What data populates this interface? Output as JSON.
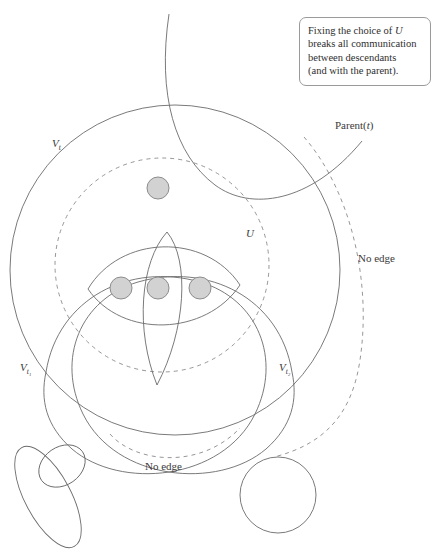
{
  "figure": {
    "title": "Fixing the choice of U breaks all communication between descendants",
    "background_color": "#ffffff",
    "stroke_color": "#6b6b6b",
    "dashed_color": "#8a8a8a",
    "node_fill_color": "#d2d2d2",
    "node_stroke_color": "#8c8c8c",
    "width": 442,
    "height": 556
  },
  "callout": {
    "line1_a": "Fixing the choice of ",
    "line1_b": "U",
    "line2": "breaks all communication",
    "line3": "between descendants",
    "line4": "(and with the parent)."
  },
  "labels": {
    "v_t": {
      "base": "V",
      "sub": "t"
    },
    "v_t1": {
      "base": "V",
      "sub": "t₁"
    },
    "v_t2": {
      "base": "V",
      "sub": "t₂"
    },
    "u": "U",
    "parent": {
      "base": "Parent(",
      "arg": "t",
      "close": ")"
    },
    "no_edge_right": "No edge",
    "no_edge_bottom": "No edge"
  },
  "nodes": [
    {
      "id": "node-top",
      "cx": 158,
      "cy": 188,
      "r": 11
    },
    {
      "id": "node-bottom-left",
      "cx": 121,
      "cy": 288,
      "r": 11
    },
    {
      "id": "node-bottom-mid",
      "cx": 158,
      "cy": 288,
      "r": 11
    },
    {
      "id": "node-bottom-right",
      "cx": 200,
      "cy": 288,
      "r": 11
    }
  ],
  "shapes": {
    "v_t_circle": {
      "type": "circle",
      "cx": 175,
      "cy": 270,
      "r": 165,
      "style": "solid"
    },
    "u_circle": {
      "type": "circle",
      "cx": 162,
      "cy": 265,
      "r": 107,
      "style": "dashed"
    },
    "parent_arc": {
      "type": "arc",
      "style": "solid"
    },
    "no_edge_arc": {
      "type": "arc",
      "style": "dashed"
    },
    "wide_lens": {
      "type": "lens",
      "style": "solid"
    },
    "narrow_lens": {
      "type": "lens",
      "style": "solid"
    },
    "v_t1_blob": {
      "type": "blob",
      "style": "solid"
    },
    "v_t2_blob": {
      "type": "blob",
      "style": "solid"
    },
    "bottom_left_ellipse_small": {
      "type": "ellipse",
      "cx": 62,
      "cy": 466,
      "rx": 25,
      "ry": 19,
      "rotate": -35,
      "style": "solid"
    },
    "bottom_left_ellipse_large": {
      "type": "ellipse",
      "cx": 48,
      "cy": 495,
      "rx": 55,
      "ry": 23,
      "rotate": 60,
      "style": "solid"
    },
    "bottom_right_circle": {
      "type": "circle",
      "cx": 278,
      "cy": 495,
      "r": 38,
      "style": "solid"
    }
  }
}
